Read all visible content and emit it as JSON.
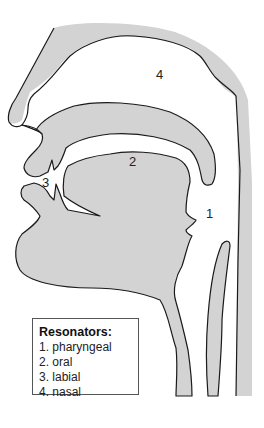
{
  "diagram": {
    "region_labels": [
      {
        "id": "1",
        "text": "1",
        "x": 206,
        "y": 207
      },
      {
        "id": "2",
        "text": "2",
        "x": 129,
        "y": 155
      },
      {
        "id": "3",
        "text": "3",
        "x": 42,
        "y": 176
      },
      {
        "id": "4",
        "text": "4",
        "x": 156,
        "y": 68
      }
    ],
    "legend": {
      "title": "Resonators:",
      "items": [
        "1. pharyngeal",
        "2. oral",
        "3. labial",
        "4. nasal"
      ]
    },
    "colors": {
      "tissue": "#d3d3d3",
      "outline": "#1a1a1a",
      "background": "#ffffff"
    }
  }
}
